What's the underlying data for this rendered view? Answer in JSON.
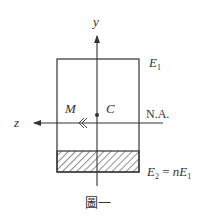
{
  "diagram": {
    "labels": {
      "y_axis": "y",
      "z_axis": "z",
      "top_material": "E",
      "top_material_sub": "1",
      "moment": "M",
      "centroid": "C",
      "neutral_axis": "N.A.",
      "bottom_material_lhs": "E",
      "bottom_material_lhs_sub": "2",
      "bottom_material_eq": " = ",
      "bottom_material_coef": "n",
      "bottom_material_rhs": "E",
      "bottom_material_rhs_sub": "1",
      "caption": "圖一"
    },
    "colors": {
      "stroke": "#333333",
      "background": "#ffffff"
    }
  }
}
